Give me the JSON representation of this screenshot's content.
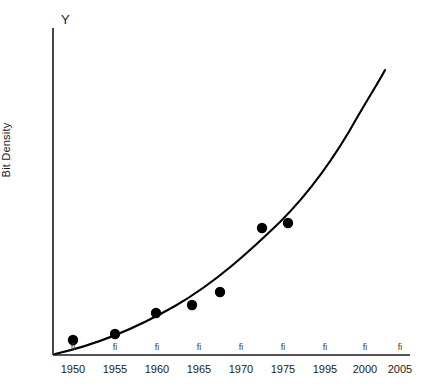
{
  "chart_data": {
    "type": "scatter",
    "title": "",
    "top_label": "Y",
    "xlabel": "",
    "ylabel": "Bit Density",
    "grid": false,
    "legend": null,
    "axis_style": "open-L",
    "xlim": [
      1946,
      2008
    ],
    "ylim": [
      0,
      100
    ],
    "tick_labels": [
      "1950",
      "1955",
      "1960",
      "1965",
      "1970",
      "1975",
      "1995",
      "2000",
      "2005"
    ],
    "tick_glyph": "fi",
    "tick_positions_px": [
      73,
      115,
      157,
      199,
      241,
      283,
      325,
      365,
      400
    ],
    "series": [
      {
        "name": "Bit density data points",
        "marker": "filled-circle",
        "color": "#000000",
        "points": [
          {
            "label": "1950",
            "x_px": 73,
            "y_px": 340,
            "x": 1950,
            "y": 2
          },
          {
            "label": "1955",
            "x_px": 115,
            "y_px": 334,
            "x": 1955,
            "y": 5
          },
          {
            "label": "1960",
            "x_px": 156,
            "y_px": 313,
            "x": 1960,
            "y": 13
          },
          {
            "label": "1965",
            "x_px": 192,
            "y_px": 305,
            "x": 1965,
            "y": 16
          },
          {
            "label": "1968",
            "x_px": 220,
            "y_px": 292,
            "x": 1968,
            "y": 21
          },
          {
            "label": "1974",
            "x_px": 262,
            "y_px": 228,
            "x": 1974,
            "y": 45
          },
          {
            "label": "1977",
            "x_px": 288,
            "y_px": 223,
            "x": 1977,
            "y": 47
          }
        ]
      }
    ],
    "fit_curve": {
      "name": "Exponential trend curve",
      "color": "#000000",
      "style": "solid",
      "path_px": "M 55 354 C 100 344 140 326 175 306 C 215 283 250 251 280 222 C 312 190 338 152 358 116 C 372 92 381 78 385 70"
    },
    "axes": {
      "origin_px": {
        "x": 53,
        "y": 355
      },
      "x_axis_end_px": {
        "x": 410,
        "y": 355
      },
      "y_axis_top_px": {
        "x": 53,
        "y": 28
      },
      "color": "#1a1a1a"
    }
  }
}
